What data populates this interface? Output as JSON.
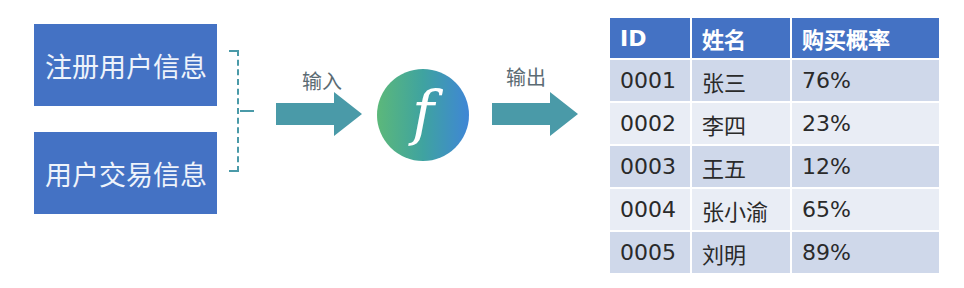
{
  "inputs": [
    {
      "label": "注册用户信息"
    },
    {
      "label": "用户交易信息"
    }
  ],
  "arrows": {
    "input_label": "输入",
    "output_label": "输出",
    "color": "#4a9aa8"
  },
  "function_node": {
    "symbol": "f",
    "gradient": [
      "#5cb87a",
      "#3f86d6"
    ]
  },
  "table": {
    "headers": [
      "ID",
      "姓名",
      "购买概率"
    ],
    "rows": [
      [
        "0001",
        "张三",
        "76%"
      ],
      [
        "0002",
        "李四",
        "23%"
      ],
      [
        "0003",
        "王五",
        "12%"
      ],
      [
        "0004",
        "张小渝",
        "65%"
      ],
      [
        "0005",
        "刘明",
        "89%"
      ]
    ],
    "header_color": "#4472c4"
  }
}
